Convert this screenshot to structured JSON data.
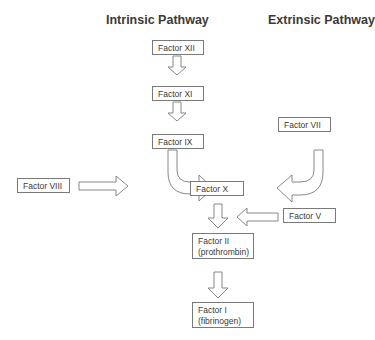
{
  "headings": {
    "intrinsic": "Intrinsic Pathway",
    "extrinsic": "Extrinsic Pathway"
  },
  "nodes": {
    "factor_xii": "Factor XII",
    "factor_xi": "Factor XI",
    "factor_ix": "Factor IX",
    "factor_viii": "Factor VIII",
    "factor_vii": "Factor VII",
    "factor_x": "Factor X",
    "factor_v": "Factor V",
    "factor_ii_line1": "Factor II",
    "factor_ii_line2": "(prothrombin)",
    "factor_i_line1": "Factor I",
    "factor_i_line2": "(fibrinogen)"
  },
  "edges": [
    {
      "from": "Factor XII",
      "to": "Factor XI"
    },
    {
      "from": "Factor XI",
      "to": "Factor IX"
    },
    {
      "from": "Factor IX",
      "to": "Factor X"
    },
    {
      "from": "Factor VIII",
      "to": "Factor X"
    },
    {
      "from": "Factor VII",
      "to": "Factor X"
    },
    {
      "from": "Factor X",
      "to": "Factor II (prothrombin)"
    },
    {
      "from": "Factor V",
      "to": "Factor II (prothrombin)"
    },
    {
      "from": "Factor II (prothrombin)",
      "to": "Factor I (fibrinogen)"
    }
  ]
}
